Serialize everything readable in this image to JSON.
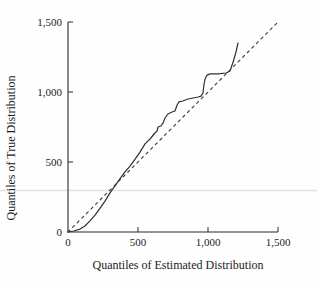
{
  "figure": {
    "background": "#fefefe",
    "text_color": "#1b1b1b",
    "axis_color": "#2a2a2a",
    "curve_color": "#303030",
    "reference_color": "#3a3a3a",
    "artifact_color": "#e2e2e2"
  },
  "chart_data": {
    "type": "line",
    "title": "",
    "xlabel": "Quantiles of Estimated Distribution",
    "ylabel": "Quantiles of True Distribution",
    "xlim": [
      0,
      1500
    ],
    "ylim": [
      0,
      1500
    ],
    "xticks": [
      0,
      500,
      1000,
      1500
    ],
    "yticks": [
      0,
      500,
      1000,
      1500
    ],
    "xtick_labels": [
      "0",
      "500",
      "1,000",
      "1,500"
    ],
    "ytick_labels": [
      "0",
      "500",
      "1,000",
      "1,500"
    ],
    "grid": false,
    "legend": "none",
    "series": [
      {
        "name": "qq-curve",
        "style": "solid",
        "points": [
          [
            0,
            0
          ],
          [
            43,
            7
          ],
          [
            86,
            21
          ],
          [
            121,
            43
          ],
          [
            157,
            79
          ],
          [
            193,
            121
          ],
          [
            229,
            171
          ],
          [
            264,
            221
          ],
          [
            300,
            279
          ],
          [
            336,
            329
          ],
          [
            371,
            379
          ],
          [
            407,
            429
          ],
          [
            443,
            471
          ],
          [
            479,
            521
          ],
          [
            514,
            571
          ],
          [
            550,
            629
          ],
          [
            586,
            664
          ],
          [
            621,
            707
          ],
          [
            636,
            721
          ],
          [
            643,
            750
          ],
          [
            664,
            757
          ],
          [
            679,
            779
          ],
          [
            693,
            814
          ],
          [
            714,
            843
          ],
          [
            743,
            857
          ],
          [
            764,
            864
          ],
          [
            779,
            907
          ],
          [
            793,
            929
          ],
          [
            821,
            936
          ],
          [
            857,
            950
          ],
          [
            893,
            957
          ],
          [
            929,
            964
          ],
          [
            950,
            971
          ],
          [
            964,
            993
          ],
          [
            971,
            1050
          ],
          [
            979,
            1093
          ],
          [
            993,
            1121
          ],
          [
            1014,
            1129
          ],
          [
            1071,
            1129
          ],
          [
            1129,
            1136
          ],
          [
            1157,
            1150
          ],
          [
            1179,
            1214
          ],
          [
            1200,
            1286
          ],
          [
            1214,
            1350
          ]
        ]
      },
      {
        "name": "reference-diagonal",
        "style": "dashed",
        "points": [
          [
            0,
            0
          ],
          [
            1500,
            1500
          ]
        ]
      }
    ]
  }
}
